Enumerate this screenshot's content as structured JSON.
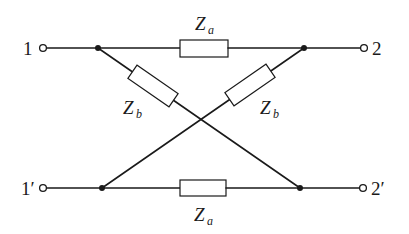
{
  "diagram": {
    "type": "lattice (X) two-port network",
    "terminals": {
      "top_left": "1",
      "top_right": "2",
      "bottom_left": "1′",
      "bottom_right": "2′"
    },
    "impedances": {
      "top_series": {
        "symbol": "Z",
        "subscript": "a"
      },
      "bottom_series": {
        "symbol": "Z",
        "subscript": "a"
      },
      "cross_left": {
        "symbol": "Z",
        "subscript": "b"
      },
      "cross_right": {
        "symbol": "Z",
        "subscript": "b"
      }
    },
    "colors": {
      "line": "#1a1a1a",
      "background": "#ffffff"
    }
  }
}
